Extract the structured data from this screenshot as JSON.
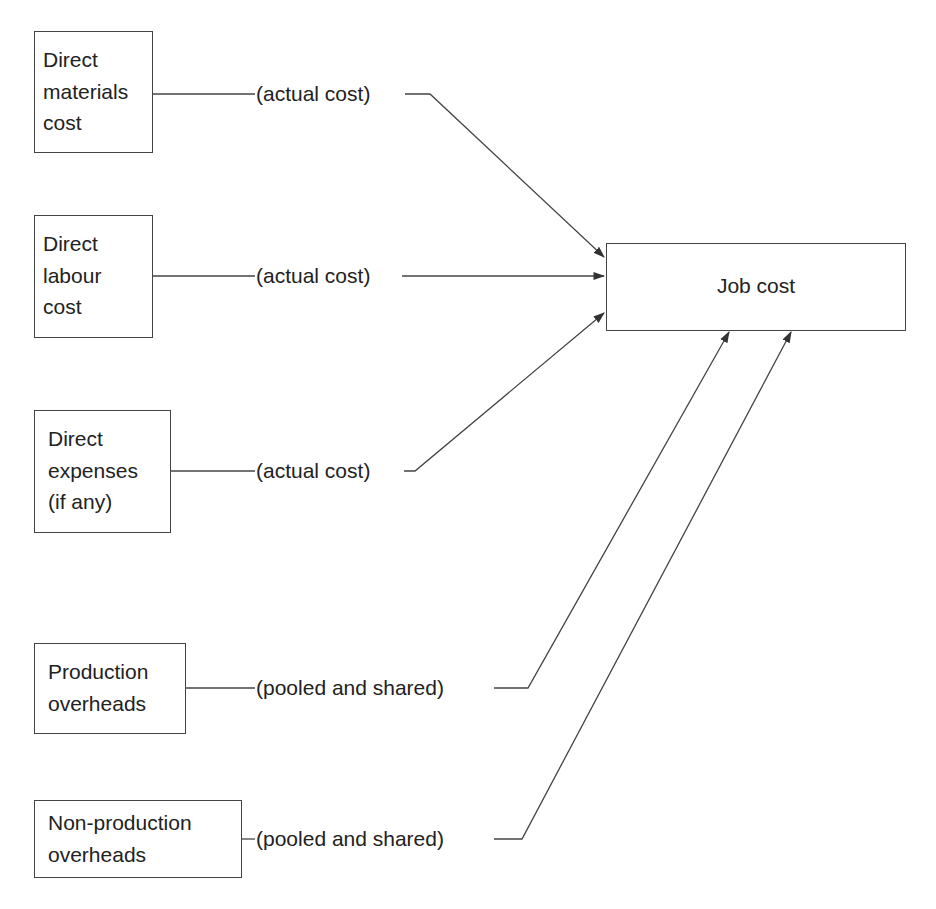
{
  "diagram": {
    "target": {
      "id": "job",
      "label": "Job cost"
    },
    "sources": [
      {
        "id": "dm",
        "lines": [
          "Direct",
          "materials",
          "cost"
        ],
        "connector_label": "(actual cost)"
      },
      {
        "id": "dl",
        "lines": [
          "Direct",
          "labour",
          "cost"
        ],
        "connector_label": "(actual cost)"
      },
      {
        "id": "de",
        "lines": [
          "Direct",
          "expenses",
          "(if any)"
        ],
        "connector_label": "(actual cost)"
      },
      {
        "id": "po",
        "lines": [
          "Production",
          "overheads"
        ],
        "connector_label": "(pooled and shared)"
      },
      {
        "id": "npo",
        "lines": [
          "Non-production",
          "overheads"
        ],
        "connector_label": "(pooled and shared)"
      }
    ],
    "colors": {
      "line": "#444444",
      "text": "#222222",
      "background": "#ffffff"
    }
  }
}
